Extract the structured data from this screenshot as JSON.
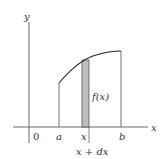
{
  "figure": {
    "caption_fragment": "",
    "axes": {
      "x_label": "x",
      "y_label": "y",
      "origin_label": "0"
    },
    "labels": {
      "a": "a",
      "b": "b",
      "x": "x",
      "x_plus_dx": "x + dx",
      "fx": "f(x)"
    },
    "colors": {
      "line": "#333333",
      "strip_fill": "#bdbdbd"
    }
  }
}
